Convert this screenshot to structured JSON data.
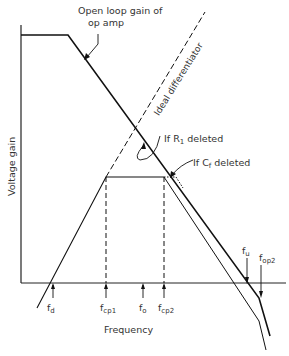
{
  "diagram": {
    "title_annotations": {
      "open_loop": "Open loop gain of op amp",
      "open_loop_line1": "Open loop gain of",
      "open_loop_line2": "op amp",
      "ideal_diff": "Ideal differentiator",
      "r1_deleted_prefix": "If R",
      "r1_deleted_sub": "1",
      "r1_deleted_suffix": " deleted",
      "cf_deleted_prefix": "If C",
      "cf_deleted_sub": "f",
      "cf_deleted_suffix": " deleted"
    },
    "axes": {
      "ylabel": "Voltage gain",
      "xlabel": "Frequency"
    },
    "frequency_markers": [
      {
        "id": "fd",
        "base": "f",
        "sub": "d"
      },
      {
        "id": "fcp1",
        "base": "f",
        "sub": "cp1"
      },
      {
        "id": "fo",
        "base": "f",
        "sub": "o"
      },
      {
        "id": "fcp2",
        "base": "f",
        "sub": "cp2"
      },
      {
        "id": "fu",
        "base": "f",
        "sub": "u"
      },
      {
        "id": "fop2",
        "base": "f",
        "sub": "op2"
      }
    ],
    "colors": {
      "line": "#111111",
      "text": "#333333",
      "background": "#ffffff"
    }
  }
}
